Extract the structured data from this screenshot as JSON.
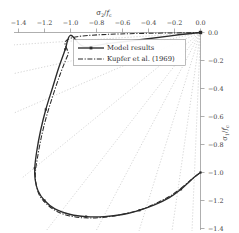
{
  "chart_data": {
    "type": "line",
    "title": "",
    "xlabel": "σ₂/fᴄ",
    "ylabel": "σ₁/fᴄ",
    "xlabel_parts": {
      "main": "σ",
      "sub": "2",
      "denom": "f",
      "denom_sub": "c"
    },
    "ylabel_parts": {
      "main": "σ",
      "sub": "1",
      "denom": "f",
      "denom_sub": "c"
    },
    "xlim": [
      -1.5,
      0.05
    ],
    "ylim": [
      -1.45,
      0.05
    ],
    "x_axis_position": "top",
    "y_axis_position": "right",
    "grid": false,
    "legend_position": "upper center",
    "xticks": [
      -1.4,
      -1.2,
      -1.0,
      -0.8,
      -0.6,
      -0.4,
      -0.2,
      0.0
    ],
    "xtick_labels": [
      "−1.4",
      "−1.2",
      "−1.0",
      "−0.8",
      "−0.6",
      "−0.4",
      "−0.2",
      "0.0"
    ],
    "yticks": [
      0.0,
      -0.2,
      -0.4,
      -0.6,
      -0.8,
      -1.0,
      -1.2,
      -1.4
    ],
    "ytick_labels": [
      "0.0",
      "−0.2",
      "−0.4",
      "−0.6",
      "−0.8",
      "−1.0",
      "−1.2",
      "−1.4"
    ],
    "series": [
      {
        "name": "Model results",
        "style": "solid-with-markers",
        "color": "#2b2b2b",
        "points": [
          [
            0.0,
            0.0
          ],
          [
            -0.2,
            -0.02
          ],
          [
            -0.45,
            -0.05
          ],
          [
            -0.72,
            -0.08
          ],
          [
            -0.9,
            -0.1
          ],
          [
            -1.0,
            -0.02
          ],
          [
            -1.04,
            -0.12
          ],
          [
            -1.09,
            -0.25
          ],
          [
            -1.14,
            -0.4
          ],
          [
            -1.19,
            -0.55
          ],
          [
            -1.23,
            -0.7
          ],
          [
            -1.26,
            -0.85
          ],
          [
            -1.275,
            -0.97
          ],
          [
            -1.272,
            -1.05
          ],
          [
            -1.25,
            -1.13
          ],
          [
            -1.2,
            -1.2
          ],
          [
            -1.12,
            -1.26
          ],
          [
            -1.0,
            -1.3
          ],
          [
            -0.88,
            -1.315
          ],
          [
            -0.74,
            -1.315
          ],
          [
            -0.6,
            -1.3
          ],
          [
            -0.47,
            -1.27
          ],
          [
            -0.35,
            -1.23
          ],
          [
            -0.24,
            -1.18
          ],
          [
            -0.15,
            -1.12
          ],
          [
            -0.08,
            -1.06
          ],
          [
            -0.03,
            -1.02
          ],
          [
            0.0,
            -1.0
          ]
        ]
      },
      {
        "name": "Kupfer et al. (1969)",
        "style": "dash-dot",
        "color": "#2b2b2b",
        "points": [
          [
            0.0,
            0.0
          ],
          [
            -0.95,
            -0.03
          ],
          [
            -1.02,
            -0.16
          ],
          [
            -1.08,
            -0.3
          ],
          [
            -1.135,
            -0.45
          ],
          [
            -1.185,
            -0.6
          ],
          [
            -1.225,
            -0.75
          ],
          [
            -1.255,
            -0.9
          ],
          [
            -1.27,
            -1.0
          ],
          [
            -1.265,
            -1.08
          ],
          [
            -1.24,
            -1.16
          ],
          [
            -1.19,
            -1.22
          ],
          [
            -1.1,
            -1.28
          ],
          [
            -0.98,
            -1.315
          ],
          [
            -0.85,
            -1.325
          ],
          [
            -0.7,
            -1.315
          ],
          [
            -0.56,
            -1.29
          ],
          [
            -0.43,
            -1.255
          ],
          [
            -0.32,
            -1.21
          ],
          [
            -0.22,
            -1.16
          ],
          [
            -0.14,
            -1.105
          ],
          [
            -0.07,
            -1.05
          ],
          [
            0.0,
            -1.0
          ]
        ]
      }
    ],
    "radial_lines": {
      "description": "dotted rays from origin showing constant stress ratios",
      "origin": [
        0.0,
        0.0
      ],
      "ratios": [
        0.08,
        0.22,
        0.42,
        0.7,
        1.0,
        1.45,
        2.6,
        6.5,
        20.0
      ],
      "color": "#b9b9b9"
    },
    "origin_marker": {
      "x": 0.0,
      "y": 0.0,
      "shape": "square"
    }
  },
  "legend": {
    "entries": [
      {
        "label": "Model results",
        "style": "solid-with-marker"
      },
      {
        "label": "Kupfer et al. (1969)",
        "style": "dash-dot"
      }
    ]
  }
}
